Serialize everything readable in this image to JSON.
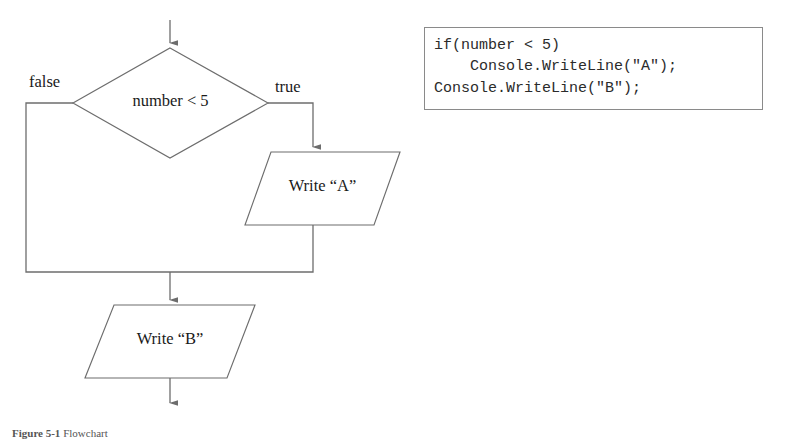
{
  "figure": {
    "caption_label": "Figure 5-1",
    "caption_text": "Flowchart"
  },
  "flowchart": {
    "decision": {
      "text": "number < 5",
      "shape": "diamond"
    },
    "branch_false_label": "false",
    "branch_true_label": "true",
    "process_true": {
      "text": "Write “A”",
      "shape": "parallelogram"
    },
    "process_after": {
      "text": "Write “B”",
      "shape": "parallelogram"
    },
    "line_color": "#6d6d6d",
    "text_color": "#1a1a1a"
  },
  "code_panel": {
    "language": "C#",
    "border_color": "#8a8a8a",
    "background_color": "#ffffff",
    "text_color": "#2b2b2b",
    "lines": [
      "if(number < 5)",
      "    Console.WriteLine(\"A\");",
      "Console.WriteLine(\"B\");"
    ],
    "listing": "if(number < 5)\n    Console.WriteLine(\"A\");\nConsole.WriteLine(\"B\");"
  }
}
